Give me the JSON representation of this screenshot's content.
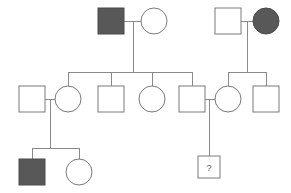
{
  "diagram": {
    "type": "pedigree-chart",
    "title": "",
    "canvas": {
      "width": 291,
      "height": 193
    },
    "colors": {
      "background": "#ffffff",
      "affected_fill": "#585858",
      "unaffected_fill": "#ffffff",
      "stroke": "#7a7a7a",
      "line": "#8a8a8a",
      "label_text": "#555555"
    },
    "legend_keys": {
      "square": "male",
      "circle": "female",
      "filled": "affected",
      "open": "unaffected",
      "question_mark": "status unknown"
    },
    "generations": [
      {
        "id": "I",
        "label": "",
        "individuals": [
          {
            "id": "I-1",
            "name": "affected-male-founder-left",
            "shape": "square",
            "sex": "male",
            "status": "affected",
            "label": "",
            "cx": 111,
            "cy": 21
          },
          {
            "id": "I-2",
            "name": "unaffected-female-founder-left",
            "shape": "circle",
            "sex": "female",
            "status": "unaffected",
            "label": "",
            "cx": 154,
            "cy": 21
          },
          {
            "id": "I-3",
            "name": "unaffected-male-founder-right",
            "shape": "square",
            "sex": "male",
            "status": "unaffected",
            "label": "",
            "cx": 228,
            "cy": 21
          },
          {
            "id": "I-4",
            "name": "affected-female-founder-right",
            "shape": "circle",
            "sex": "female",
            "status": "affected",
            "label": "",
            "cx": 266,
            "cy": 21
          }
        ]
      },
      {
        "id": "II",
        "label": "",
        "individuals": [
          {
            "id": "II-1",
            "name": "unaffected-male-spouse-left",
            "shape": "square",
            "sex": "male",
            "status": "unaffected",
            "label": "",
            "cx": 32,
            "cy": 99
          },
          {
            "id": "II-2",
            "name": "unaffected-female-child-1",
            "shape": "circle",
            "sex": "female",
            "status": "unaffected",
            "label": "",
            "cx": 68,
            "cy": 99
          },
          {
            "id": "II-3",
            "name": "unaffected-male-child-2",
            "shape": "square",
            "sex": "male",
            "status": "unaffected",
            "label": "",
            "cx": 111,
            "cy": 99
          },
          {
            "id": "II-4",
            "name": "unaffected-female-child-3",
            "shape": "circle",
            "sex": "female",
            "status": "unaffected",
            "label": "",
            "cx": 152,
            "cy": 99
          },
          {
            "id": "II-5",
            "name": "unaffected-male-child-4",
            "shape": "square",
            "sex": "male",
            "status": "unaffected",
            "label": "",
            "cx": 192,
            "cy": 99
          },
          {
            "id": "II-6",
            "name": "unaffected-female-child-right-1",
            "shape": "circle",
            "sex": "female",
            "status": "unaffected",
            "label": "",
            "cx": 228,
            "cy": 99
          },
          {
            "id": "II-7",
            "name": "unaffected-male-child-right-2",
            "shape": "square",
            "sex": "male",
            "status": "unaffected",
            "label": "",
            "cx": 266,
            "cy": 99
          }
        ]
      },
      {
        "id": "III",
        "label": "",
        "individuals": [
          {
            "id": "III-1",
            "name": "affected-male-grandchild",
            "shape": "square",
            "sex": "male",
            "status": "affected",
            "label": "",
            "cx": 32,
            "cy": 172
          },
          {
            "id": "III-2",
            "name": "unaffected-female-grandchild",
            "shape": "circle",
            "sex": "female",
            "status": "unaffected",
            "label": "",
            "cx": 79,
            "cy": 172
          },
          {
            "id": "III-3",
            "name": "unknown-status-male-grandchild",
            "shape": "square",
            "sex": "male",
            "status": "unknown",
            "label": "?",
            "cx": 209,
            "cy": 167
          }
        ]
      }
    ],
    "matings": [
      {
        "id": "M1",
        "name": "mating-I1-I2",
        "partners": [
          "I-1",
          "I-2"
        ],
        "y": 21,
        "x1": 124,
        "x2": 142
      },
      {
        "id": "M2",
        "name": "mating-I3-I4",
        "partners": [
          "I-3",
          "I-4"
        ],
        "y": 21,
        "x1": 241,
        "x2": 254
      },
      {
        "id": "M3",
        "name": "mating-II1-II2",
        "partners": [
          "II-1",
          "II-2"
        ],
        "y": 99,
        "x1": 45,
        "x2": 56
      },
      {
        "id": "M4",
        "name": "mating-II5-II6",
        "partners": [
          "II-5",
          "II-6"
        ],
        "y": 99,
        "x1": 205,
        "x2": 216
      }
    ],
    "sibships": [
      {
        "id": "S1",
        "name": "sibship-gen2-left",
        "parent_mating": "M1",
        "children": [
          "II-2",
          "II-3",
          "II-4",
          "II-5"
        ],
        "descent_x": 133,
        "descent_y1": 27,
        "sib_y": 72,
        "sib_x1": 68,
        "sib_x2": 192
      },
      {
        "id": "S2",
        "name": "sibship-gen2-right",
        "parent_mating": "M2",
        "children": [
          "II-6",
          "II-7"
        ],
        "descent_x": 247,
        "descent_y1": 27,
        "sib_y": 72,
        "sib_x1": 228,
        "sib_x2": 266
      },
      {
        "id": "S3",
        "name": "sibship-gen3-left",
        "parent_mating": "M3",
        "children": [
          "III-1",
          "III-2"
        ],
        "descent_x": 50,
        "descent_y1": 99,
        "sib_y": 148,
        "sib_x1": 32,
        "sib_x2": 79
      },
      {
        "id": "S4",
        "name": "sibship-gen3-right",
        "parent_mating": "M4",
        "children": [
          "III-3"
        ],
        "descent_x": 209,
        "descent_y1": 99,
        "sib_y": 155,
        "sib_x1": 209,
        "sib_x2": 209
      }
    ],
    "symbol_size": {
      "square_side": 26,
      "circle_radius": 13,
      "small_square_side": 22
    }
  }
}
